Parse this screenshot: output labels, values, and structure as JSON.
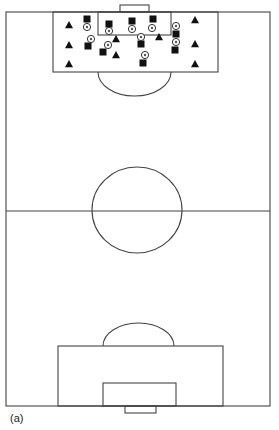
{
  "figure": {
    "caption": "(a)",
    "type": "soccer-pitch-training-diagram",
    "line_color": "#444444",
    "marker_color": "#111111"
  },
  "pitch": {
    "outline": {
      "x1": 6,
      "y1": 12,
      "x2": 270,
      "y2": 406
    },
    "halfway_line_y": 211,
    "center_circle": {
      "cx": 137,
      "cy": 210,
      "rx": 45,
      "ry": 43
    },
    "top": {
      "penalty_box": {
        "x": 53,
        "y": 12,
        "w": 165,
        "h": 60
      },
      "goal_area": {
        "x": 98,
        "y": 12,
        "w": 73,
        "h": 23
      },
      "goal": {
        "x": 120,
        "y": 5,
        "w": 29,
        "h": 7
      },
      "arc": {
        "x1": 98,
        "x2": 171,
        "y": 72,
        "depth": 24
      }
    },
    "bottom": {
      "penalty_box": {
        "x": 58,
        "y": 346,
        "w": 165,
        "h": 60
      },
      "goal_area": {
        "x": 103,
        "y": 383,
        "w": 73,
        "h": 23
      },
      "goal": {
        "x": 125,
        "y": 406,
        "w": 31,
        "h": 7
      },
      "arc": {
        "x1": 103,
        "x2": 174,
        "y": 346,
        "depth": 23
      }
    }
  },
  "legend_symbols": {
    "triangle": "attacker-marker",
    "square": "defender-marker",
    "circle": "ball-or-cone-marker"
  },
  "markers": {
    "triangles": [
      {
        "x": 69,
        "y": 25
      },
      {
        "x": 69,
        "y": 45
      },
      {
        "x": 69,
        "y": 64
      },
      {
        "x": 116,
        "y": 39
      },
      {
        "x": 116,
        "y": 55
      },
      {
        "x": 159,
        "y": 37
      },
      {
        "x": 195,
        "y": 20
      },
      {
        "x": 195,
        "y": 44
      },
      {
        "x": 195,
        "y": 64
      }
    ],
    "squares": [
      {
        "x": 87,
        "y": 19
      },
      {
        "x": 88,
        "y": 46
      },
      {
        "x": 103,
        "y": 52
      },
      {
        "x": 109,
        "y": 24
      },
      {
        "x": 132,
        "y": 21
      },
      {
        "x": 153,
        "y": 19
      },
      {
        "x": 141,
        "y": 44
      },
      {
        "x": 143,
        "y": 63
      },
      {
        "x": 176,
        "y": 34
      },
      {
        "x": 175,
        "y": 50
      }
    ],
    "circles": [
      {
        "x": 87,
        "y": 27
      },
      {
        "x": 91,
        "y": 39
      },
      {
        "x": 108,
        "y": 45
      },
      {
        "x": 109,
        "y": 31
      },
      {
        "x": 132,
        "y": 29
      },
      {
        "x": 152,
        "y": 28
      },
      {
        "x": 141,
        "y": 37
      },
      {
        "x": 145,
        "y": 55
      },
      {
        "x": 176,
        "y": 26
      },
      {
        "x": 176,
        "y": 42
      }
    ]
  }
}
